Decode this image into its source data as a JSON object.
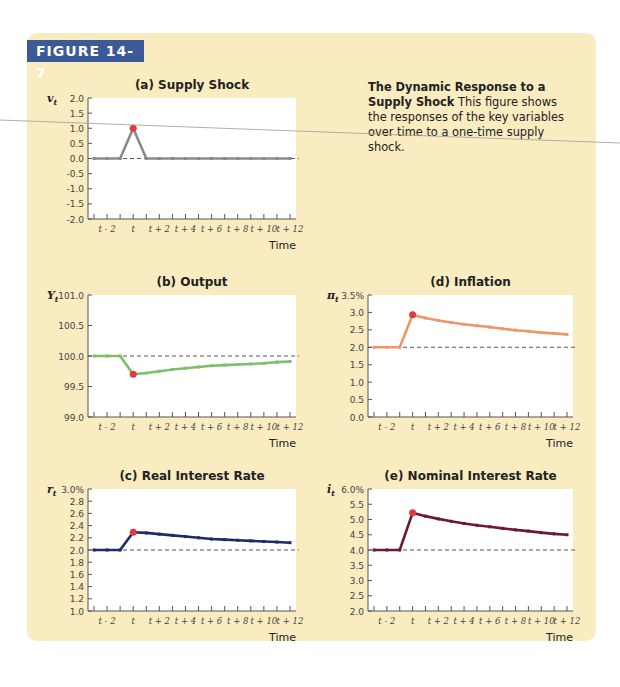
{
  "figure": {
    "label": "FIGURE 14-7",
    "caption_title": "The Dynamic Response to a Supply Shock",
    "caption_body": "This figure shows the responses of the key variables over time to a one-time supply shock."
  },
  "colors": {
    "panel_bg": "#f8ecc0",
    "label_bg": "#3d5a98",
    "highlight_point": "#e0393e"
  },
  "chart_data": [
    {
      "id": "a",
      "type": "line",
      "title": "(a) Supply Shock",
      "ylabel": "v_t",
      "xlabel": "Time",
      "x": [
        "t-3",
        "t-2",
        "t-1",
        "t",
        "t+1",
        "t+2",
        "t+3",
        "t+4",
        "t+5",
        "t+6",
        "t+7",
        "t+8",
        "t+9",
        "t+10",
        "t+11",
        "t+12"
      ],
      "xtick_labels": [
        "t - 2",
        "t",
        "t + 2",
        "t + 4",
        "t + 6",
        "t + 8",
        "t + 10",
        "t + 12"
      ],
      "values": [
        0,
        0,
        0,
        1.0,
        0,
        0,
        0,
        0,
        0,
        0,
        0,
        0,
        0,
        0,
        0,
        0
      ],
      "ylim": [
        -2.0,
        2.0
      ],
      "yticks": [
        "2.0",
        "1.5",
        "1.0",
        "0.5",
        "0.0",
        "-0.5",
        "-1.0",
        "-1.5",
        "-2.0"
      ],
      "baseline": 0.0,
      "color": "#8a8a8a",
      "highlight_index": 3,
      "grid": false
    },
    {
      "id": "b",
      "type": "line",
      "title": "(b) Output",
      "ylabel": "Y_t",
      "xlabel": "Time",
      "x": [
        "t-3",
        "t-2",
        "t-1",
        "t",
        "t+1",
        "t+2",
        "t+3",
        "t+4",
        "t+5",
        "t+6",
        "t+7",
        "t+8",
        "t+9",
        "t+10",
        "t+11",
        "t+12"
      ],
      "xtick_labels": [
        "t - 2",
        "t",
        "t + 2",
        "t + 4",
        "t + 6",
        "t + 8",
        "t + 10",
        "t + 12"
      ],
      "values": [
        100.0,
        100.0,
        100.0,
        99.7,
        99.72,
        99.75,
        99.78,
        99.8,
        99.82,
        99.84,
        99.85,
        99.86,
        99.87,
        99.88,
        99.9,
        99.91
      ],
      "ylim": [
        99.0,
        101.0
      ],
      "yticks": [
        "101.0",
        "100.5",
        "100.0",
        "99.5",
        "99.0"
      ],
      "baseline": 100.0,
      "color": "#7fbf6a",
      "highlight_index": 3,
      "grid": false
    },
    {
      "id": "d",
      "type": "line",
      "title": "(d) Inflation",
      "ylabel": "π_t",
      "xlabel": "Time",
      "x": [
        "t-3",
        "t-2",
        "t-1",
        "t",
        "t+1",
        "t+2",
        "t+3",
        "t+4",
        "t+5",
        "t+6",
        "t+7",
        "t+8",
        "t+9",
        "t+10",
        "t+11",
        "t+12"
      ],
      "xtick_labels": [
        "t - 2",
        "t",
        "t + 2",
        "t + 4",
        "t + 6",
        "t + 8",
        "t + 10",
        "t + 12"
      ],
      "values": [
        2.0,
        2.0,
        2.0,
        2.93,
        2.84,
        2.77,
        2.71,
        2.66,
        2.62,
        2.58,
        2.53,
        2.49,
        2.46,
        2.42,
        2.4,
        2.37
      ],
      "ylim": [
        0.0,
        3.5
      ],
      "yticks": [
        "3.5%",
        "3.0",
        "2.5",
        "2.0",
        "1.5",
        "1.0",
        "0.5",
        "0.0"
      ],
      "baseline": 2.0,
      "color": "#f0956a",
      "highlight_index": 3,
      "grid": false
    },
    {
      "id": "c",
      "type": "line",
      "title": "(c) Real Interest Rate",
      "ylabel": "r_t",
      "xlabel": "Time",
      "x": [
        "t-3",
        "t-2",
        "t-1",
        "t",
        "t+1",
        "t+2",
        "t+3",
        "t+4",
        "t+5",
        "t+6",
        "t+7",
        "t+8",
        "t+9",
        "t+10",
        "t+11",
        "t+12"
      ],
      "xtick_labels": [
        "t - 2",
        "t",
        "t + 2",
        "t + 4",
        "t + 6",
        "t + 8",
        "t + 10",
        "t + 12"
      ],
      "values": [
        2.0,
        2.0,
        2.0,
        2.29,
        2.28,
        2.26,
        2.24,
        2.22,
        2.2,
        2.18,
        2.17,
        2.16,
        2.15,
        2.14,
        2.13,
        2.12
      ],
      "ylim": [
        1.0,
        3.0
      ],
      "yticks": [
        "3.0%",
        "2.8",
        "2.6",
        "2.4",
        "2.2",
        "2.0",
        "1.8",
        "1.6",
        "1.4",
        "1.2",
        "1.0"
      ],
      "baseline": 2.0,
      "color": "#1f2a6b",
      "highlight_index": 3,
      "grid": false
    },
    {
      "id": "e",
      "type": "line",
      "title": "(e) Nominal Interest Rate",
      "ylabel": "i_t",
      "xlabel": "Time",
      "x": [
        "t-3",
        "t-2",
        "t-1",
        "t",
        "t+1",
        "t+2",
        "t+3",
        "t+4",
        "t+5",
        "t+6",
        "t+7",
        "t+8",
        "t+9",
        "t+10",
        "t+11",
        "t+12"
      ],
      "xtick_labels": [
        "t - 2",
        "t",
        "t + 2",
        "t + 4",
        "t + 6",
        "t + 8",
        "t + 10",
        "t + 12"
      ],
      "values": [
        4.0,
        4.0,
        4.0,
        5.22,
        5.11,
        5.02,
        4.94,
        4.87,
        4.81,
        4.76,
        4.71,
        4.66,
        4.62,
        4.57,
        4.53,
        4.5
      ],
      "ylim": [
        2.0,
        6.0
      ],
      "yticks": [
        "6.0%",
        "5.5",
        "5.0",
        "4.5",
        "4.0",
        "3.5",
        "3.0",
        "2.5",
        "2.0"
      ],
      "baseline": 4.0,
      "color": "#6e1a2c",
      "highlight_index": 3,
      "grid": false
    }
  ]
}
